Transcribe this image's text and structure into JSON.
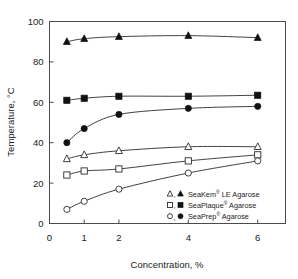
{
  "chart_data": {
    "type": "line",
    "title": "",
    "xlabel": "Concentration, %",
    "ylabel": "Temperature, °C",
    "xlim": [
      0,
      6.8
    ],
    "ylim": [
      0,
      100
    ],
    "xticks": [
      0,
      1,
      2,
      4,
      6
    ],
    "xticklabels": [
      "0",
      "1",
      "2",
      "4",
      "6"
    ],
    "yticks": [
      0,
      20,
      40,
      60,
      80,
      100
    ],
    "yticklabels": [
      "0",
      "20",
      "40",
      "60",
      "80",
      "100"
    ],
    "grid": false,
    "legend_position": "lower right",
    "x": [
      0.5,
      1,
      2,
      4,
      6
    ],
    "series": [
      {
        "name": "SeaKem LE Agarose melting",
        "legend_label": "SeaKem® LE Agarose",
        "marker": "filled-triangle",
        "values": [
          90,
          91.5,
          92.5,
          93,
          92
        ]
      },
      {
        "name": "SeaPlaque Agarose melting",
        "legend_label": "SeaPlaque® Agarose",
        "marker": "filled-square",
        "values": [
          61,
          62,
          63,
          63,
          63.5
        ]
      },
      {
        "name": "SeaPrep Agarose melting",
        "legend_label": "SeaPrep® Agarose",
        "marker": "filled-circle",
        "values": [
          40,
          47,
          54,
          57,
          58
        ]
      },
      {
        "name": "SeaKem LE Agarose gelling",
        "legend_label": "SeaKem® LE Agarose",
        "marker": "open-triangle",
        "values": [
          32,
          34,
          36,
          38,
          38
        ]
      },
      {
        "name": "SeaPlaque Agarose gelling",
        "legend_label": "SeaPlaque® Agarose",
        "marker": "open-square",
        "values": [
          24,
          26,
          27,
          31,
          34
        ]
      },
      {
        "name": "SeaPrep Agarose gelling",
        "legend_label": "SeaPrep® Agarose",
        "marker": "open-circle",
        "values": [
          7,
          11,
          17,
          25,
          31
        ]
      }
    ],
    "legend": [
      {
        "symbols": "open-triangle, filled-triangle",
        "brand": "SeaKem",
        "mark": "®",
        "suffix": "LE Agarose",
        "label": "SeaKem® LE Agarose"
      },
      {
        "symbols": "open-square, filled-square",
        "brand": "SeaPlaque",
        "mark": "®",
        "suffix": "Agarose",
        "label": "SeaPlaque® Agarose"
      },
      {
        "symbols": "open-circle, filled-circle",
        "brand": "SeaPrep",
        "mark": "®",
        "suffix": "Agarose",
        "label": "SeaPrep® Agarose"
      }
    ],
    "colors": {
      "axis": "#4a4a4a",
      "line": "#2b2b2b",
      "marker_fill": "#111111",
      "marker_open_fill": "#ffffff",
      "background": "#ffffff",
      "text": "#1a1a1a"
    }
  },
  "axes": {
    "y_title": "Temperature, °C",
    "x_title": "Concentration, %",
    "y_ticks": [
      "100",
      "80",
      "60",
      "40",
      "20",
      "0"
    ],
    "x_ticks": [
      "0",
      "1",
      "2",
      "4",
      "6"
    ]
  }
}
